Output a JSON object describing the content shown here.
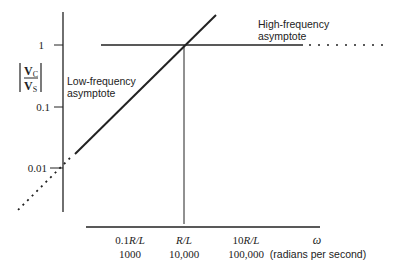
{
  "diagram": {
    "type": "bode-magnitude-asymptotes",
    "y_axis": {
      "label_numerator": "V",
      "label_numerator_sub": "C",
      "label_denominator": "V",
      "label_denominator_sub": "S",
      "ticks": [
        "1",
        "0.1",
        "0.01"
      ]
    },
    "x_axis": {
      "symbol": "ω",
      "units": "(radians per second)",
      "ticks": [
        {
          "symbolic_prefix": "0.1",
          "symbolic": "R/L",
          "numeric": "1000"
        },
        {
          "symbolic_prefix": "",
          "symbolic": "R/L",
          "numeric": "10,000"
        },
        {
          "symbolic_prefix": "10",
          "symbolic": "R/L",
          "numeric": "100,000"
        }
      ]
    },
    "annotations": {
      "low_frequency_line1": "Low-frequency",
      "low_frequency_line2": "asymptote",
      "high_frequency_line1": "High-frequency",
      "high_frequency_line2": "asymptote"
    },
    "colors": {
      "line": "#222222",
      "background": "#ffffff"
    }
  }
}
